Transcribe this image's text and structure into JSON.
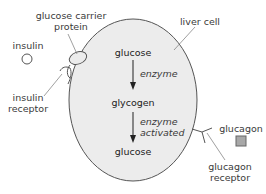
{
  "diagram": {
    "colors": {
      "cell_fill": "#ececec",
      "stroke": "#555555",
      "glucagon_fill": "#a8a8a8",
      "text": "#3a3a3a"
    },
    "labels": {
      "glucose_carrier_protein_line1": "glucose carrier",
      "glucose_carrier_protein_line2": "protein",
      "liver_cell": "liver cell",
      "insulin": "insulin",
      "insulin_receptor_line1": "insulin",
      "insulin_receptor_line2": "receptor",
      "glucagon": "glucagon",
      "glucagon_receptor_line1": "glucagon",
      "glucagon_receptor_line2": "receptor"
    },
    "pathway": {
      "steps": [
        "glucose",
        "glycogen",
        "glucose"
      ],
      "arrows": [
        {
          "label_line1": "enzyme",
          "label_line2": ""
        },
        {
          "label_line1": "enzyme",
          "label_line2": "activated"
        }
      ]
    },
    "icons": {
      "insulin": "circle-icon",
      "glucagon": "square-icon"
    }
  }
}
